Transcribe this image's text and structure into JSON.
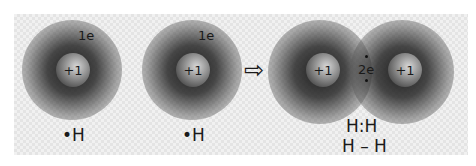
{
  "atoms": [
    {
      "nucleus": "+1",
      "electron": "1e",
      "label": "•H"
    },
    {
      "nucleus": "+1",
      "electron": "1e",
      "label": "•H"
    }
  ],
  "arrow": "⇨",
  "molecule": {
    "nuclei": [
      "+1",
      "+1"
    ],
    "shared_electrons": "2e",
    "lewis": "H:H",
    "structural": "H – H"
  }
}
